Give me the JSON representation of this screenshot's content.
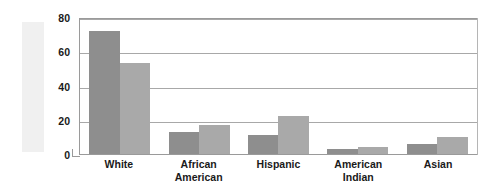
{
  "chart_data": {
    "type": "bar",
    "title": "",
    "subtitle": "",
    "xlabel": "",
    "ylabel": "Percent",
    "categories": [
      "White",
      "African American",
      "Hispanic",
      "American Indian",
      "Asian"
    ],
    "category_lines": [
      [
        "White"
      ],
      [
        "African",
        "American"
      ],
      [
        "Hispanic"
      ],
      [
        "American",
        "Indian"
      ],
      [
        "Asian"
      ]
    ],
    "series": [
      {
        "name": "Series 1",
        "color": "#8e8e8e",
        "values": [
          72,
          13,
          11,
          3,
          6
        ]
      },
      {
        "name": "Series 2",
        "color": "#a9a9a9",
        "values": [
          53,
          17,
          22,
          4,
          10
        ]
      }
    ],
    "ylim": [
      0,
      80
    ],
    "yticks": [
      80,
      60,
      40,
      20,
      0
    ],
    "ytick_labels": [
      "80",
      "60",
      "40",
      "20",
      "0"
    ],
    "grid": true,
    "grid_axis": "y",
    "legend": false,
    "legend_position": "none",
    "plot_frame": true,
    "annotations": []
  },
  "figure": {
    "axis_title_vertical": "Percent",
    "background_color": "#ffffff",
    "frame_color": "#9a9a9a",
    "gridline_color": "#a8a8a8",
    "label_color": "#1a1a1a",
    "ylabel_band_color": "#f0f0f0"
  }
}
